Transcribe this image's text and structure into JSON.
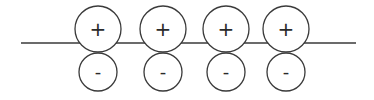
{
  "diagram": {
    "stroke_color": "#3a3a3a",
    "line": {
      "x1": 21,
      "x2": 356,
      "y": 43
    },
    "pairs": [
      {
        "cx": 98,
        "top": {
          "label": "+",
          "cy": 29,
          "r": 23
        },
        "bottom": {
          "label": "-",
          "cy": 72,
          "r": 19
        }
      },
      {
        "cx": 163,
        "top": {
          "label": "+",
          "cy": 29,
          "r": 23
        },
        "bottom": {
          "label": "-",
          "cy": 72,
          "r": 19
        }
      },
      {
        "cx": 226,
        "top": {
          "label": "+",
          "cy": 29,
          "r": 23
        },
        "bottom": {
          "label": "-",
          "cy": 72,
          "r": 19
        }
      },
      {
        "cx": 286,
        "top": {
          "label": "+",
          "cy": 29,
          "r": 23
        },
        "bottom": {
          "label": "-",
          "cy": 72,
          "r": 19
        }
      }
    ]
  }
}
